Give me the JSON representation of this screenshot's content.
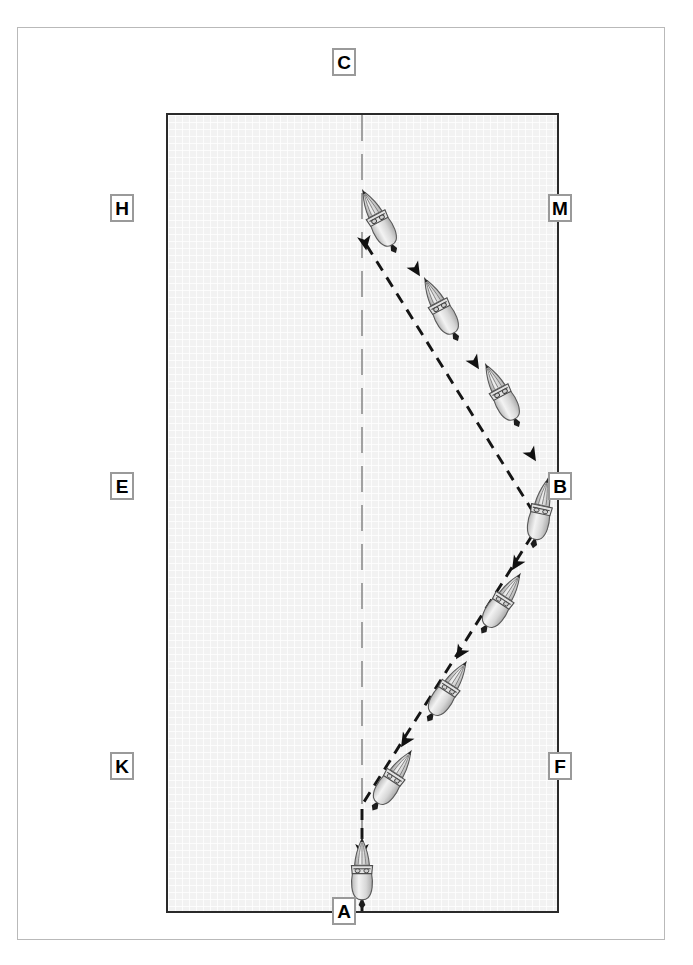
{
  "diagram": {
    "type": "dressage-arena-figure",
    "arena": {
      "width_px": 393,
      "height_px": 800,
      "fill_color": "#f2f2f2",
      "border_color": "#2a2a2a",
      "centerline_color": "#8c8c8c",
      "track_color": "#1a1a1a"
    },
    "markers": [
      {
        "id": "marker-c",
        "label": "C",
        "side": "top",
        "x": 332,
        "y": 48
      },
      {
        "id": "marker-h",
        "label": "H",
        "side": "left",
        "x": 110,
        "y": 194
      },
      {
        "id": "marker-m",
        "label": "M",
        "side": "right",
        "x": 548,
        "y": 194
      },
      {
        "id": "marker-e",
        "label": "E",
        "side": "left",
        "x": 110,
        "y": 472
      },
      {
        "id": "marker-b",
        "label": "B",
        "side": "right",
        "x": 548,
        "y": 472
      },
      {
        "id": "marker-k",
        "label": "K",
        "side": "left",
        "x": 110,
        "y": 752
      },
      {
        "id": "marker-f",
        "label": "F",
        "side": "right",
        "x": 548,
        "y": 752
      },
      {
        "id": "marker-a",
        "label": "A",
        "side": "bottom",
        "x": 332,
        "y": 897
      }
    ],
    "centerline": {
      "name": "arena-centerline",
      "from": {
        "x": 194,
        "y": 0
      },
      "to": {
        "x": 194,
        "y": 800
      },
      "style": "long-dash"
    },
    "path": {
      "name": "movement-track",
      "style": "dashed",
      "direction": "from A upward to B then up-left to C",
      "points": [
        {
          "x": 194,
          "y": 800
        },
        {
          "x": 194,
          "y": 690
        },
        {
          "x": 372,
          "y": 408
        },
        {
          "x": 194,
          "y": 130
        }
      ]
    },
    "horses": [
      {
        "id": "horse-1",
        "x": 194,
        "y": 760,
        "angle": 0,
        "note": "entering at A on centerline"
      },
      {
        "id": "horse-2",
        "x": 222,
        "y": 665,
        "angle": 33,
        "note": "leg-yield start"
      },
      {
        "id": "horse-3",
        "x": 276,
        "y": 578,
        "angle": 33,
        "note": "leg-yield"
      },
      {
        "id": "horse-4",
        "x": 330,
        "y": 490,
        "angle": 33,
        "note": "leg-yield"
      },
      {
        "id": "horse-5",
        "x": 372,
        "y": 405,
        "angle": 15,
        "note": "arriving at B"
      },
      {
        "id": "horse-6",
        "x": 336,
        "y": 283,
        "angle": -27,
        "note": "leg-yield back"
      },
      {
        "id": "horse-7",
        "x": 272,
        "y": 197,
        "angle": -27,
        "note": "leg-yield back"
      },
      {
        "id": "horse-8",
        "x": 212,
        "y": 110,
        "angle": -27,
        "note": "returning toward C"
      }
    ],
    "arrows": [
      {
        "x": 194,
        "y": 732,
        "angle": 0
      },
      {
        "x": 238,
        "y": 622,
        "angle": 33
      },
      {
        "x": 292,
        "y": 534,
        "angle": 33
      },
      {
        "x": 349,
        "y": 443,
        "angle": 25
      },
      {
        "x": 364,
        "y": 338,
        "angle": -27
      },
      {
        "x": 306,
        "y": 247,
        "angle": -27
      },
      {
        "x": 246,
        "y": 160,
        "angle": -27
      },
      {
        "x": 196,
        "y": 128,
        "angle": -10
      }
    ]
  }
}
